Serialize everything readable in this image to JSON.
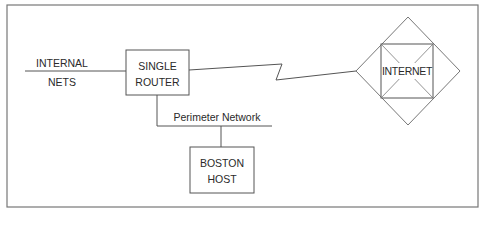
{
  "diagram": {
    "type": "network-topology",
    "nodes": [
      {
        "id": "internal_nets",
        "label_line1": "INTERNAL",
        "label_line2": "NETS",
        "shape": "line-endpoint"
      },
      {
        "id": "router",
        "label_line1": "SINGLE",
        "label_line2": "ROUTER",
        "shape": "rectangle"
      },
      {
        "id": "internet",
        "label": "INTERNET",
        "shape": "diamond-with-square"
      },
      {
        "id": "boston_host",
        "label_line1": "BOSTON",
        "label_line2": "HOST",
        "shape": "rectangle"
      }
    ],
    "edges": [
      {
        "from": "internal_nets",
        "to": "router",
        "style": "straight"
      },
      {
        "from": "router",
        "to": "internet",
        "style": "lightning-zigzag"
      },
      {
        "from": "router",
        "to": "perimeter_network",
        "style": "straight"
      },
      {
        "from": "perimeter_network",
        "to": "boston_host",
        "style": "straight"
      }
    ],
    "segments": [
      {
        "id": "perimeter_network",
        "label": "Perimeter Network"
      }
    ]
  },
  "colors": {
    "line": "#555555",
    "frame": "#777777",
    "text": "#2a2a2a",
    "background": "#ffffff"
  }
}
